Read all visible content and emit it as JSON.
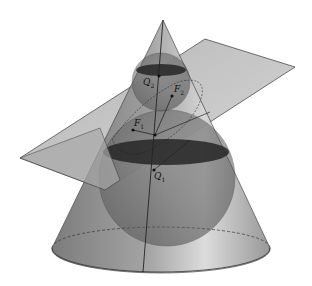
{
  "figure": {
    "colors": {
      "background": "#ffffff",
      "cone_fill": "#7a7a7a",
      "plane_fill": "#9a9a9a",
      "sphere_fill": "#5e5e5e",
      "contact_circle_fill": "#2b2b2b",
      "stroke": "#333333"
    }
  },
  "labels": {
    "q2": {
      "base": "Q",
      "sub": "2"
    },
    "f2": {
      "base": "F",
      "sub": "2"
    },
    "f1": {
      "base": "F",
      "sub": "1"
    },
    "q1": {
      "base": "Q",
      "sub": "1"
    }
  }
}
